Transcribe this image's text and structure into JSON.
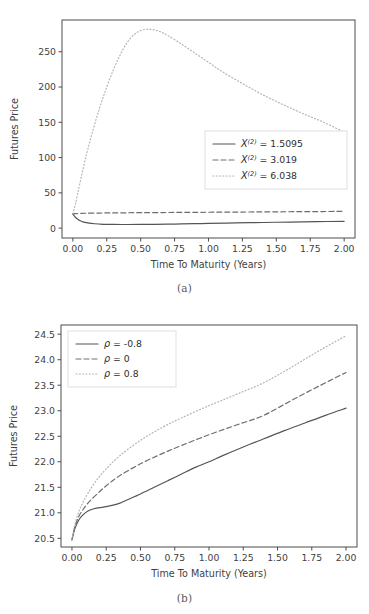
{
  "figure": {
    "panels": [
      {
        "caption": "(a)",
        "name": "panel-a"
      },
      {
        "caption": "(b)",
        "name": "panel-b"
      }
    ]
  },
  "chart_data": [
    {
      "type": "line",
      "title": "",
      "xlabel": "Time To Maturity (Years)",
      "ylabel": "Futures Price",
      "xlim": [
        -0.08,
        2.08
      ],
      "ylim": [
        -14,
        295
      ],
      "xticks": [
        0,
        0.25,
        0.5,
        0.75,
        1,
        1.25,
        1.5,
        1.75,
        2
      ],
      "xticklabels": [
        "0.00",
        "0.25",
        "0.50",
        "0.75",
        "1.00",
        "1.25",
        "1.50",
        "1.75",
        "2.00"
      ],
      "yticks": [
        0,
        50,
        100,
        150,
        200,
        250
      ],
      "yticklabels": [
        "0",
        "50",
        "100",
        "150",
        "200",
        "250"
      ],
      "grid": false,
      "legend_position": "center-right",
      "legend_symbol": "X",
      "legend_superscript": "(2)",
      "series": [
        {
          "name": "X^(2) = 1.5095",
          "value_text": "1.5095",
          "style": "solid",
          "color": "#555555",
          "x": [
            0,
            0.02,
            0.05,
            0.08,
            0.12,
            0.16,
            0.2,
            0.25,
            0.3,
            0.4,
            0.5,
            0.6,
            0.75,
            0.9,
            1.0,
            1.2,
            1.4,
            1.6,
            1.8,
            2.0
          ],
          "y": [
            20.2,
            15.0,
            10.8,
            8.6,
            7.0,
            6.2,
            5.8,
            5.4,
            5.2,
            5.1,
            5.2,
            5.4,
            5.8,
            6.3,
            6.6,
            7.3,
            8.0,
            8.6,
            9.2,
            9.7
          ]
        },
        {
          "name": "X^(2) = 3.019",
          "value_text": "3.019",
          "style": "dashed",
          "color": "#6e6e6e",
          "x": [
            0,
            0.02,
            0.05,
            0.1,
            0.2,
            0.3,
            0.5,
            0.75,
            1.0,
            1.25,
            1.5,
            1.75,
            2.0
          ],
          "y": [
            20.3,
            20.5,
            20.8,
            21.1,
            21.4,
            21.6,
            21.9,
            22.2,
            22.5,
            22.8,
            23.1,
            23.4,
            23.7
          ]
        },
        {
          "name": "X^(2) = 6.038",
          "value_text": "6.038",
          "style": "dotted",
          "color": "#b4b4b4",
          "x": [
            0,
            0.02,
            0.05,
            0.1,
            0.15,
            0.2,
            0.25,
            0.3,
            0.35,
            0.4,
            0.45,
            0.5,
            0.55,
            0.6,
            0.65,
            0.7,
            0.8,
            0.9,
            1.0,
            1.1,
            1.25,
            1.4,
            1.55,
            1.7,
            1.85,
            2.0
          ],
          "y": [
            20.5,
            35,
            62,
            104,
            140,
            172,
            200,
            225,
            246,
            263,
            274,
            280,
            282,
            281,
            278,
            273,
            261,
            248,
            235,
            222,
            205,
            189,
            175,
            162,
            150,
            136
          ]
        }
      ]
    },
    {
      "type": "line",
      "title": "",
      "xlabel": "Time To Maturity (Years)",
      "ylabel": "Futures Price",
      "xlim": [
        -0.08,
        2.08
      ],
      "ylim": [
        20.33,
        24.68
      ],
      "xticks": [
        0,
        0.25,
        0.5,
        0.75,
        1,
        1.25,
        1.5,
        1.75,
        2
      ],
      "xticklabels": [
        "0.00",
        "0.25",
        "0.50",
        "0.75",
        "1.00",
        "1.25",
        "1.50",
        "1.75",
        "2.00"
      ],
      "yticks": [
        20.5,
        21.0,
        21.5,
        22.0,
        22.5,
        23.0,
        23.5,
        24.0,
        24.5
      ],
      "yticklabels": [
        "20.5",
        "21.0",
        "21.5",
        "22.0",
        "22.5",
        "23.0",
        "23.5",
        "24.0",
        "24.5"
      ],
      "grid": false,
      "legend_position": "top-left",
      "legend_symbol": "ρ",
      "series": [
        {
          "name": "ρ = -0.8",
          "value_text": "-0.8",
          "style": "solid",
          "color": "#555555",
          "x": [
            0,
            0.02,
            0.05,
            0.08,
            0.12,
            0.16,
            0.2,
            0.25,
            0.3,
            0.35,
            0.4,
            0.5,
            0.6,
            0.7,
            0.8,
            0.9,
            1.0,
            1.1,
            1.25,
            1.4,
            1.55,
            1.7,
            1.85,
            2.0
          ],
          "y": [
            20.47,
            20.68,
            20.86,
            20.96,
            21.04,
            21.08,
            21.1,
            21.12,
            21.15,
            21.19,
            21.25,
            21.37,
            21.5,
            21.63,
            21.76,
            21.89,
            22.0,
            22.12,
            22.29,
            22.45,
            22.61,
            22.76,
            22.91,
            23.05
          ]
        },
        {
          "name": "ρ = 0",
          "value_text": "0",
          "style": "dashed",
          "color": "#6e6e6e",
          "x": [
            0,
            0.02,
            0.05,
            0.08,
            0.12,
            0.18,
            0.25,
            0.35,
            0.5,
            0.65,
            0.8,
            1.0,
            1.2,
            1.4,
            1.6,
            1.8,
            2.0
          ],
          "y": [
            20.47,
            20.72,
            20.93,
            21.06,
            21.2,
            21.36,
            21.53,
            21.73,
            21.96,
            22.15,
            22.32,
            22.53,
            22.72,
            22.91,
            23.2,
            23.48,
            23.75
          ]
        },
        {
          "name": "ρ = 0.8",
          "value_text": "0.8",
          "style": "dotted",
          "color": "#b4b4b4",
          "x": [
            0,
            0.02,
            0.05,
            0.08,
            0.12,
            0.18,
            0.25,
            0.35,
            0.5,
            0.65,
            0.8,
            1.0,
            1.2,
            1.4,
            1.6,
            1.8,
            2.0
          ],
          "y": [
            20.47,
            20.76,
            21.02,
            21.2,
            21.4,
            21.64,
            21.86,
            22.12,
            22.42,
            22.66,
            22.86,
            23.1,
            23.32,
            23.55,
            23.85,
            24.17,
            24.47
          ]
        }
      ]
    }
  ]
}
